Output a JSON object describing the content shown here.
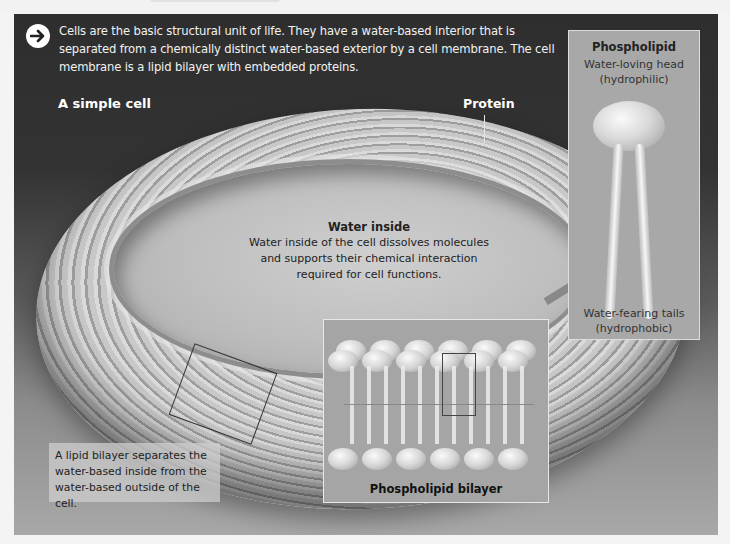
{
  "intro": {
    "icon": "arrow-right-circle-icon",
    "text": "Cells are the basic structural unit of life. They have a water-based interior that is separated from a chemically distinct water-based exterior by a cell membrane. The cell membrane is a lipid bilayer with embedded proteins."
  },
  "labels": {
    "heading": "A simple cell",
    "protein": "Protein"
  },
  "water_inside": {
    "title": "Water inside",
    "description": "Water inside of the cell dissolves molecules and supports their chemical interaction required for cell functions."
  },
  "caption": {
    "text": "A lipid bilayer separates the water-based inside from the water-based outside of the cell."
  },
  "phospholipid": {
    "title": "Phospholipid",
    "head_label_1": "Water-loving head",
    "head_label_2": "(hydrophilic)",
    "tail_label_1": "Water-fearing tails",
    "tail_label_2": "(hydrophobic)"
  },
  "bilayer": {
    "label": "Phospholipid bilayer"
  },
  "colors": {
    "panel_top": "#2e2e2e",
    "panel_bottom": "#a8a8a8",
    "label_light": "#ffffff",
    "label_dark": "#222222",
    "inset_box": "#a8a8a8"
  }
}
